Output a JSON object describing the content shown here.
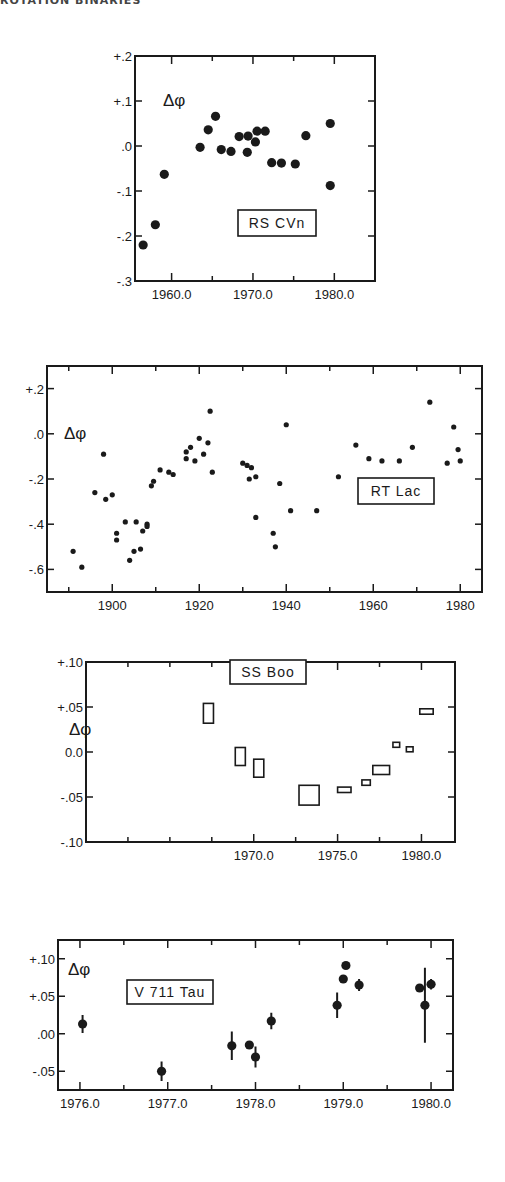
{
  "header": {
    "text": "ROTATION BINARIES"
  },
  "chart_data": [
    {
      "type": "scatter",
      "title": "RS CVn",
      "legend_label": "RS CVn",
      "ylabel": "Δφ",
      "xlabel": "",
      "xlim": [
        1955.5,
        1985.0
      ],
      "ylim": [
        -0.3,
        0.2
      ],
      "xticks": [
        1960.0,
        1970.0,
        1980.0
      ],
      "xtick_labels": [
        "1960.0",
        "1970.0",
        "1980.0"
      ],
      "yticks": [
        0.2,
        0.1,
        0.0,
        -0.1,
        -0.2,
        -0.3
      ],
      "ytick_labels": [
        "+.2",
        "+.1",
        ".0",
        "-.1",
        "-.2",
        "-.3"
      ],
      "marker": "filled-circle",
      "grid": false,
      "points": [
        {
          "x": 1956.5,
          "y": -0.22
        },
        {
          "x": 1958.0,
          "y": -0.175
        },
        {
          "x": 1959.1,
          "y": -0.063
        },
        {
          "x": 1963.5,
          "y": -0.003
        },
        {
          "x": 1964.5,
          "y": 0.036
        },
        {
          "x": 1965.4,
          "y": 0.066
        },
        {
          "x": 1966.1,
          "y": -0.008
        },
        {
          "x": 1967.3,
          "y": -0.012
        },
        {
          "x": 1968.3,
          "y": 0.021
        },
        {
          "x": 1969.3,
          "y": -0.014
        },
        {
          "x": 1969.4,
          "y": 0.022
        },
        {
          "x": 1970.3,
          "y": 0.009
        },
        {
          "x": 1970.5,
          "y": 0.033
        },
        {
          "x": 1971.5,
          "y": 0.033
        },
        {
          "x": 1972.3,
          "y": -0.037
        },
        {
          "x": 1973.5,
          "y": -0.038
        },
        {
          "x": 1975.2,
          "y": -0.04
        },
        {
          "x": 1976.5,
          "y": 0.023
        },
        {
          "x": 1979.5,
          "y": 0.05
        },
        {
          "x": 1979.5,
          "y": -0.088
        }
      ]
    },
    {
      "type": "scatter",
      "title": "RT Lac",
      "legend_label": "RT Lac",
      "ylabel": "Δφ",
      "xlabel": "",
      "xlim": [
        1885,
        1985
      ],
      "ylim": [
        -0.7,
        0.3
      ],
      "xticks": [
        1900,
        1920,
        1940,
        1960,
        1980
      ],
      "xtick_labels": [
        "1900",
        "1920",
        "1940",
        "1960",
        "1980"
      ],
      "yticks": [
        0.2,
        0.0,
        -0.2,
        -0.4,
        -0.6
      ],
      "ytick_labels": [
        "+.2",
        ".0",
        "-.2",
        "-.4",
        "-.6"
      ],
      "marker": "small-filled-circle",
      "grid": false,
      "points": [
        {
          "x": 1891,
          "y": -0.52
        },
        {
          "x": 1893,
          "y": -0.59
        },
        {
          "x": 1896,
          "y": -0.26
        },
        {
          "x": 1898,
          "y": -0.09
        },
        {
          "x": 1898.5,
          "y": -0.29
        },
        {
          "x": 1900,
          "y": -0.27
        },
        {
          "x": 1901,
          "y": -0.44
        },
        {
          "x": 1901,
          "y": -0.47
        },
        {
          "x": 1903,
          "y": -0.39
        },
        {
          "x": 1904,
          "y": -0.56
        },
        {
          "x": 1905,
          "y": -0.52
        },
        {
          "x": 1905.5,
          "y": -0.39
        },
        {
          "x": 1906.5,
          "y": -0.51
        },
        {
          "x": 1907,
          "y": -0.43
        },
        {
          "x": 1908,
          "y": -0.4
        },
        {
          "x": 1908,
          "y": -0.41
        },
        {
          "x": 1909,
          "y": -0.23
        },
        {
          "x": 1909.5,
          "y": -0.21
        },
        {
          "x": 1911,
          "y": -0.16
        },
        {
          "x": 1913,
          "y": -0.17
        },
        {
          "x": 1914,
          "y": -0.18
        },
        {
          "x": 1917,
          "y": -0.08
        },
        {
          "x": 1917,
          "y": -0.11
        },
        {
          "x": 1918,
          "y": -0.06
        },
        {
          "x": 1919,
          "y": -0.12
        },
        {
          "x": 1920,
          "y": -0.02
        },
        {
          "x": 1921,
          "y": -0.09
        },
        {
          "x": 1922,
          "y": -0.04
        },
        {
          "x": 1922.5,
          "y": 0.1
        },
        {
          "x": 1923,
          "y": -0.17
        },
        {
          "x": 1930,
          "y": -0.13
        },
        {
          "x": 1931,
          "y": -0.14
        },
        {
          "x": 1932,
          "y": -0.15
        },
        {
          "x": 1931.5,
          "y": -0.2
        },
        {
          "x": 1933,
          "y": -0.19
        },
        {
          "x": 1933,
          "y": -0.37
        },
        {
          "x": 1937,
          "y": -0.44
        },
        {
          "x": 1937.5,
          "y": -0.5
        },
        {
          "x": 1938.5,
          "y": -0.22
        },
        {
          "x": 1940,
          "y": 0.04
        },
        {
          "x": 1941,
          "y": -0.34
        },
        {
          "x": 1947,
          "y": -0.34
        },
        {
          "x": 1952,
          "y": -0.19
        },
        {
          "x": 1956,
          "y": -0.05
        },
        {
          "x": 1959,
          "y": -0.11
        },
        {
          "x": 1962,
          "y": -0.12
        },
        {
          "x": 1966,
          "y": -0.12
        },
        {
          "x": 1969,
          "y": -0.06
        },
        {
          "x": 1973,
          "y": 0.14
        },
        {
          "x": 1977,
          "y": -0.13
        },
        {
          "x": 1978.5,
          "y": 0.03
        },
        {
          "x": 1979.5,
          "y": -0.07
        },
        {
          "x": 1980,
          "y": -0.12
        }
      ]
    },
    {
      "type": "scatter",
      "title": "SS Boo",
      "legend_label": "SS Boo",
      "ylabel": "Δφ",
      "xlabel": "",
      "xlim": [
        1960.0,
        1982.0
      ],
      "ylim": [
        -0.1,
        0.1
      ],
      "xticks": [
        1970.0,
        1975.0,
        1980.0
      ],
      "xtick_labels": [
        "1970.0",
        "1975.0",
        "1980.0"
      ],
      "yticks": [
        0.1,
        0.05,
        0.0,
        -0.05,
        -0.1
      ],
      "ytick_labels": [
        "+.10",
        "+.05",
        "0.0",
        "-.05",
        "-.10"
      ],
      "marker": "open-rectangle (error box)",
      "grid": false,
      "points": [
        {
          "x": 1967.3,
          "y": 0.043,
          "dx": 0.3,
          "dy": 0.011
        },
        {
          "x": 1969.2,
          "y": -0.005,
          "dx": 0.3,
          "dy": 0.01
        },
        {
          "x": 1970.3,
          "y": -0.018,
          "dx": 0.3,
          "dy": 0.01
        },
        {
          "x": 1973.3,
          "y": -0.048,
          "dx": 0.6,
          "dy": 0.011
        },
        {
          "x": 1975.4,
          "y": -0.042,
          "dx": 0.4,
          "dy": 0.003
        },
        {
          "x": 1976.7,
          "y": -0.034,
          "dx": 0.25,
          "dy": 0.003
        },
        {
          "x": 1977.6,
          "y": -0.02,
          "dx": 0.5,
          "dy": 0.005
        },
        {
          "x": 1978.5,
          "y": 0.008,
          "dx": 0.2,
          "dy": 0.002
        },
        {
          "x": 1979.3,
          "y": 0.003,
          "dx": 0.2,
          "dy": 0.002
        },
        {
          "x": 1980.3,
          "y": 0.045,
          "dx": 0.4,
          "dy": 0.003
        }
      ]
    },
    {
      "type": "scatter",
      "title": "V 711 Tau",
      "legend_label": "V 711 Tau",
      "ylabel": "Δφ",
      "xlabel": "",
      "xlim": [
        1975.75,
        1980.25
      ],
      "ylim": [
        -0.075,
        0.125
      ],
      "xticks": [
        1976.0,
        1977.0,
        1978.0,
        1979.0,
        1980.0
      ],
      "xtick_labels": [
        "1976.0",
        "1977.0",
        "1978.0",
        "1979.0",
        "1980.0"
      ],
      "yticks": [
        0.1,
        0.05,
        0.0,
        -0.05
      ],
      "ytick_labels": [
        "+.10",
        "+.05",
        ".00",
        "-.05"
      ],
      "marker": "filled-circle with error bars",
      "grid": false,
      "points": [
        {
          "x": 1976.03,
          "y": 0.013,
          "err": 0.012
        },
        {
          "x": 1976.93,
          "y": -0.05,
          "err": 0.013
        },
        {
          "x": 1977.73,
          "y": -0.016,
          "err": 0.019
        },
        {
          "x": 1977.93,
          "y": -0.015,
          "err": 0.0
        },
        {
          "x": 1978.0,
          "y": -0.031,
          "err": 0.014
        },
        {
          "x": 1978.18,
          "y": 0.017,
          "err": 0.011
        },
        {
          "x": 1978.93,
          "y": 0.038,
          "err": 0.017
        },
        {
          "x": 1979.0,
          "y": 0.073,
          "err": 0.0
        },
        {
          "x": 1979.03,
          "y": 0.091,
          "err": 0.0
        },
        {
          "x": 1979.18,
          "y": 0.065,
          "err": 0.008
        },
        {
          "x": 1979.87,
          "y": 0.061,
          "err": 0.0
        },
        {
          "x": 1979.93,
          "y": 0.038,
          "err": 0.05
        },
        {
          "x": 1980.0,
          "y": 0.066,
          "err": 0.007
        }
      ]
    }
  ]
}
